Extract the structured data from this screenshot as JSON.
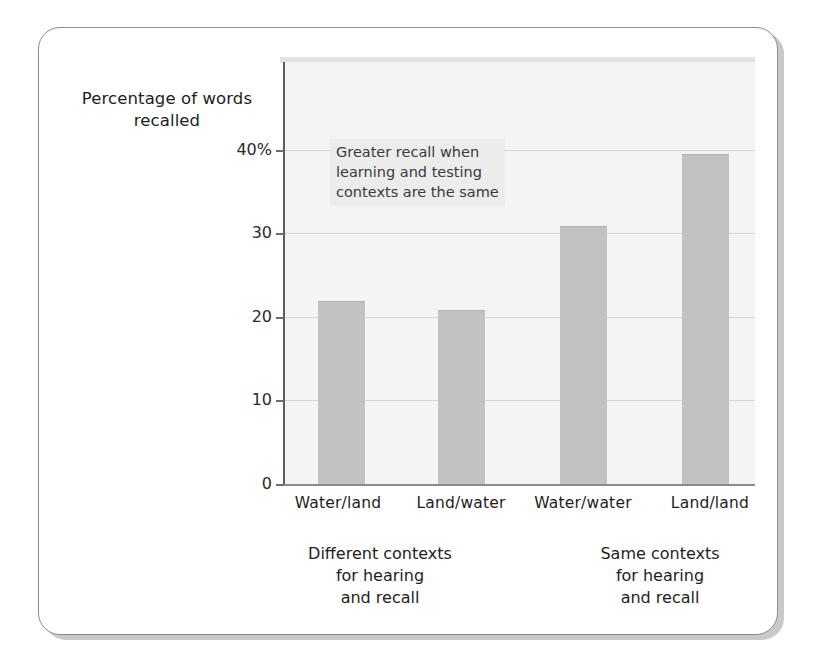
{
  "figure": {
    "y_axis_title": "Percentage of\nwords recalled",
    "annotation": "Greater recall when\nlearning and testing\ncontexts are the same",
    "group_captions": [
      {
        "text": "Different contexts\nfor hearing\nand recall"
      },
      {
        "text": "Same contexts\nfor hearing\nand recall"
      }
    ],
    "colors": {
      "bar_fill": "#c2c2c2",
      "panel_background": "#f4f4f4",
      "gridline": "#d6d6d6",
      "axis": "#5b5b5b",
      "annotation_background": "#ececec",
      "text": "#1d1d1d",
      "card_border": "#8c8c8c"
    }
  },
  "chart_data": {
    "type": "bar",
    "title": "",
    "subtitle": "",
    "xlabel": "",
    "ylabel": "Percentage of words recalled",
    "categories": [
      "Water/land",
      "Land/water",
      "Water/water",
      "Land/land"
    ],
    "values": [
      21.8,
      20.7,
      30.8,
      39.4
    ],
    "ylim": [
      0,
      45
    ],
    "yticks": [
      0,
      10,
      20,
      30,
      40
    ],
    "ytick_labels": [
      "0",
      "10",
      "20",
      "30",
      "40%"
    ],
    "grid": true,
    "legend": "none",
    "groups": [
      {
        "label": "Different contexts for hearing and recall",
        "categories": [
          "Water/land",
          "Land/water"
        ]
      },
      {
        "label": "Same contexts for hearing and recall",
        "categories": [
          "Water/water",
          "Land/land"
        ]
      }
    ],
    "annotations": [
      {
        "text": "Greater recall when learning and testing contexts are the same"
      }
    ]
  }
}
